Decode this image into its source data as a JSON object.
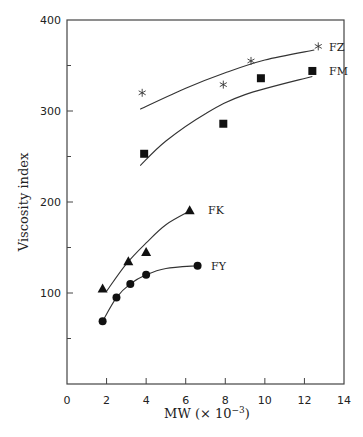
{
  "chart_data": {
    "type": "scatter",
    "title": "",
    "xlabel": "MW (× 10⁻³)",
    "ylabel": "Viscosity index",
    "xlim": [
      0,
      14
    ],
    "ylim": [
      0,
      400
    ],
    "x_ticks": [
      "0",
      "2",
      "4",
      "6",
      "8",
      "10",
      "12",
      "14"
    ],
    "y_ticks": [
      "100",
      "200",
      "300",
      "400"
    ],
    "grid": false,
    "legend": "inline labels at curve ends",
    "series": [
      {
        "name": "FZ",
        "marker": "asterisk",
        "points": [
          [
            3.8,
            320
          ],
          [
            7.9,
            329
          ],
          [
            9.3,
            355
          ],
          [
            12.7,
            371
          ]
        ],
        "fit": [
          [
            3.7,
            302
          ],
          [
            6,
            325
          ],
          [
            8,
            342
          ],
          [
            10,
            356
          ],
          [
            12.5,
            367
          ]
        ]
      },
      {
        "name": "FM",
        "marker": "square",
        "points": [
          [
            3.9,
            253
          ],
          [
            7.9,
            286
          ],
          [
            9.8,
            336
          ],
          [
            12.4,
            344
          ]
        ],
        "fit": [
          [
            3.7,
            240
          ],
          [
            5,
            267
          ],
          [
            7,
            297
          ],
          [
            9,
            318
          ],
          [
            12.4,
            338
          ]
        ]
      },
      {
        "name": "FK",
        "marker": "triangle",
        "points": [
          [
            1.8,
            105
          ],
          [
            3.1,
            135
          ],
          [
            4.0,
            145
          ],
          [
            6.2,
            191
          ]
        ],
        "fit": [
          [
            2.0,
            102
          ],
          [
            3,
            132
          ],
          [
            4,
            155
          ],
          [
            5,
            175
          ],
          [
            6.2,
            190
          ]
        ]
      },
      {
        "name": "FY",
        "marker": "circle",
        "points": [
          [
            1.8,
            69
          ],
          [
            2.5,
            95
          ],
          [
            3.2,
            110
          ],
          [
            4.0,
            120
          ],
          [
            6.6,
            130
          ]
        ],
        "fit": [
          [
            1.8,
            69
          ],
          [
            2.5,
            95
          ],
          [
            3.2,
            110
          ],
          [
            4.0,
            120
          ],
          [
            5,
            127
          ],
          [
            6.6,
            130
          ]
        ]
      }
    ]
  },
  "labels": {
    "xlabel_main": "MW (× 10",
    "xlabel_exp": "−3",
    "xlabel_close": ")",
    "ylabel": "Viscosity index",
    "series": {
      "FZ": "FZ",
      "FM": "FM",
      "FK": "FK",
      "FY": "FY"
    }
  }
}
